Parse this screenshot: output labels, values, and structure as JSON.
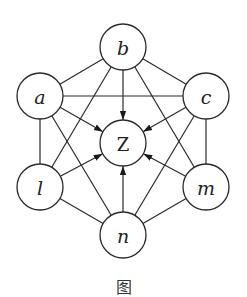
{
  "diagram": {
    "type": "graph",
    "nodes": [
      {
        "id": "b",
        "label": "b",
        "x": 123,
        "y": 47
      },
      {
        "id": "a",
        "label": "a",
        "x": 40,
        "y": 96
      },
      {
        "id": "c",
        "label": "c",
        "x": 206,
        "y": 96
      },
      {
        "id": "Z",
        "label": "Z",
        "x": 123,
        "y": 143
      },
      {
        "id": "l",
        "label": "l",
        "x": 40,
        "y": 187
      },
      {
        "id": "m",
        "label": "m",
        "x": 206,
        "y": 187
      },
      {
        "id": "n",
        "label": "n",
        "x": 123,
        "y": 235
      }
    ],
    "undirected_edges": [
      [
        "a",
        "b"
      ],
      [
        "b",
        "c"
      ],
      [
        "a",
        "c"
      ],
      [
        "a",
        "l"
      ],
      [
        "c",
        "m"
      ],
      [
        "l",
        "n"
      ],
      [
        "m",
        "n"
      ],
      [
        "a",
        "n"
      ],
      [
        "c",
        "n"
      ],
      [
        "b",
        "l"
      ],
      [
        "b",
        "m"
      ]
    ],
    "directed_edges": [
      [
        "a",
        "Z"
      ],
      [
        "b",
        "Z"
      ],
      [
        "c",
        "Z"
      ],
      [
        "l",
        "Z"
      ],
      [
        "m",
        "Z"
      ],
      [
        "n",
        "Z"
      ]
    ],
    "caption": "图"
  }
}
